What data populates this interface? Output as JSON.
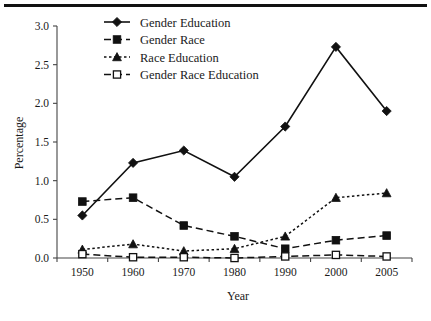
{
  "chart_data": {
    "type": "line",
    "title": "",
    "xlabel": "Year",
    "ylabel": "Percentage",
    "categories": [
      "1950",
      "1960",
      "1970",
      "1980",
      "1990",
      "2000",
      "2005"
    ],
    "x": [
      1950,
      1960,
      1970,
      1980,
      1990,
      2000,
      2005
    ],
    "ylim": [
      0.0,
      3.0
    ],
    "yticks": [
      "0.0",
      "0.5",
      "1.0",
      "1.5",
      "2.0",
      "2.5",
      "3.0"
    ],
    "ytick_values": [
      0.0,
      0.5,
      1.0,
      1.5,
      2.0,
      2.5,
      3.0
    ],
    "grid": false,
    "legend_position": "top-center",
    "series": [
      {
        "name": "Gender Education",
        "marker": "filled-diamond",
        "line_style": "solid",
        "values": [
          0.55,
          1.23,
          1.39,
          1.05,
          1.7,
          2.73,
          1.9
        ]
      },
      {
        "name": "Gender Race",
        "marker": "filled-square",
        "line_style": "dashed",
        "values": [
          0.73,
          0.78,
          0.42,
          0.28,
          0.12,
          0.23,
          0.29
        ]
      },
      {
        "name": "Race Education",
        "marker": "filled-triangle",
        "line_style": "dotted",
        "values": [
          0.11,
          0.18,
          0.09,
          0.12,
          0.28,
          0.78,
          0.84
        ]
      },
      {
        "name": "Gender Race Education",
        "marker": "open-square",
        "line_style": "dashed",
        "values": [
          0.05,
          0.01,
          0.01,
          0.0,
          0.02,
          0.04,
          0.02
        ]
      }
    ]
  },
  "legend": {
    "items": [
      {
        "label": "Gender Education"
      },
      {
        "label": "Gender Race"
      },
      {
        "label": "Race Education"
      },
      {
        "label": "Gender Race Education"
      }
    ]
  },
  "axes": {
    "y_title": "Percentage",
    "x_title": "Year"
  }
}
